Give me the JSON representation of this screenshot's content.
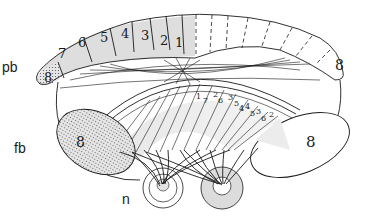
{
  "diagram": {
    "labels": {
      "pb": "pb",
      "fb": "fb",
      "n": "n"
    },
    "pb_segments_left": [
      "8",
      "7",
      "6",
      "5",
      "4",
      "3",
      "2",
      "1"
    ],
    "pb_segment_right_end": "8",
    "fb_left_lobe": "8",
    "fb_right_lobe": "8",
    "fan_pairs": [
      {
        "a": "1",
        "b": "7"
      },
      {
        "a": "2",
        "b": "6"
      },
      {
        "a": "3",
        "b": "5"
      },
      {
        "a": "4",
        "b": "4"
      },
      {
        "a": "5",
        "b": "3"
      },
      {
        "a": "6",
        "b": "2"
      },
      {
        "a": "7",
        "b": "1"
      }
    ],
    "colors": {
      "ink": "#1a1a1a",
      "shade": "#d9d9d9",
      "stipple": "#555555",
      "background": "#ffffff"
    }
  }
}
